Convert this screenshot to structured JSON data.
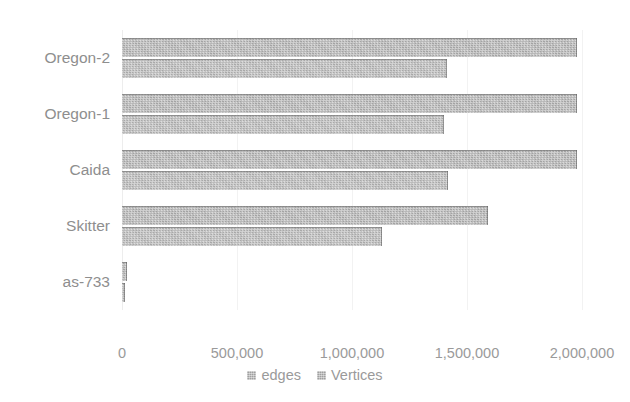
{
  "chart_data": {
    "type": "bar",
    "orientation": "horizontal",
    "title": "",
    "xlabel": "",
    "ylabel": "",
    "xlim": [
      0,
      2000000
    ],
    "grid": true,
    "legend_position": "bottom",
    "categories": [
      "as-733",
      "Skitter",
      "Caida",
      "Oregon-1",
      "Oregon-2"
    ],
    "xticks": [
      0,
      500000,
      1000000,
      1500000,
      2000000
    ],
    "xticklabels": [
      "0",
      "500,000",
      "1,000,000",
      "1,500,000",
      "2,000,000"
    ],
    "series": [
      {
        "name": "edges",
        "color": "#b0b0b0",
        "values": [
          22000,
          1591000,
          1978000,
          1978000,
          1978000
        ]
      },
      {
        "name": "Vertices",
        "color": "#b5b5b5",
        "values": [
          13000,
          1130000,
          1417000,
          1400000,
          1413000
        ]
      }
    ]
  },
  "legend": {
    "items": [
      {
        "label": "edges"
      },
      {
        "label": "Vertices"
      }
    ]
  }
}
